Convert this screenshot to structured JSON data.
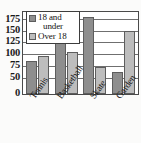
{
  "chart_data": {
    "type": "bar",
    "title": "",
    "xlabel": "",
    "ylabel": "",
    "categories": [
      "Tennis",
      "Basketball",
      "Skate",
      "Garden"
    ],
    "series": [
      {
        "name": "18 and under",
        "color": "#8e8e8e",
        "values": [
          75,
          125,
          175,
          50
        ]
      },
      {
        "name": "Over 18",
        "color": "#bdbdbd",
        "values": [
          88,
          95,
          62,
          143
        ]
      }
    ],
    "yticks": [
      0,
      50,
      75,
      100,
      125,
      150,
      175
    ],
    "ytick_labels": [
      "0",
      "50",
      "75",
      "100",
      "125",
      "150",
      "175"
    ],
    "ylim": [
      0,
      187.5
    ],
    "grid": true,
    "legend_position": "upper left"
  },
  "legend": {
    "entries": [
      {
        "label_line1": "18 and",
        "label_line2": "under",
        "swatch": "dark-gray-swatch"
      },
      {
        "label_line1": "Over 18",
        "label_line2": "",
        "swatch": "light-gray-swatch"
      }
    ]
  },
  "axis": {
    "y_labels": [
      "175",
      "150",
      "125",
      "100",
      "75",
      "50",
      "0"
    ],
    "x_labels": [
      "Tennis",
      "Basketball",
      "Skate",
      "Garden"
    ]
  }
}
